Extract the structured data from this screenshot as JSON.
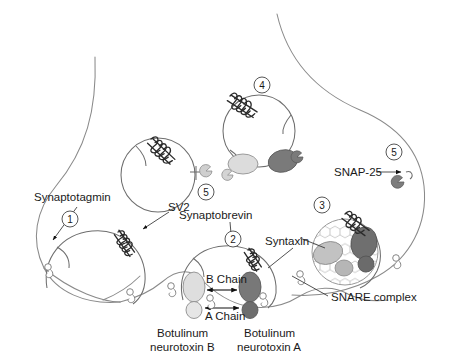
{
  "figure": {
    "type": "biological-schematic"
  },
  "labels": {
    "synaptotagmin": "Synaptotagmin",
    "sv2": "SV2",
    "synaptobrevin": "Synaptobrevin",
    "syntaxin": "Syntaxin",
    "snap25": "SNAP-25",
    "snare_complex": "SNARE complex",
    "b_chain": "B Chain",
    "a_chain": "A Chain",
    "toxin_b_line1": "Botulinum",
    "toxin_b_line2": "neurotoxin B",
    "toxin_a_line1": "Botulinum",
    "toxin_a_line2": "neurotoxin A"
  },
  "steps": {
    "one": "1",
    "two": "2",
    "three": "3",
    "four": "4",
    "five_center": "5",
    "five_right": "5"
  },
  "colors": {
    "membrane": "#8a8a8a",
    "vesicle": "#6e6e6e",
    "text": "#1a1a1a",
    "coil_dark": "#2b2b2b",
    "protein_light": "#dcdcdc",
    "protein_mid": "#b4b4b4",
    "protein_dark": "#777777",
    "protein_darker": "#6a6a6a",
    "honeycomb": "#f2f2f2",
    "background": "#ffffff"
  },
  "elements": {
    "toxin_b_chain_label": "B Chain",
    "toxin_a_chain_label": "A Chain",
    "vesicle_count": 5,
    "numbered_steps": 6
  }
}
